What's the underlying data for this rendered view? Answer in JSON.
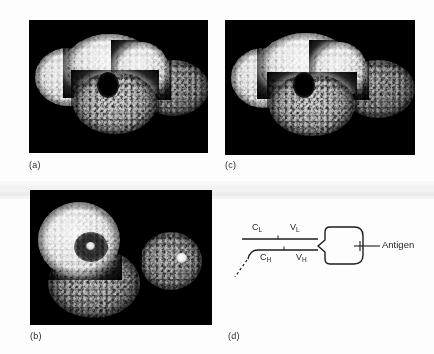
{
  "figure": {
    "background_color": "#fdfdfd",
    "panel_background": "#000000"
  },
  "panels": [
    {
      "id": "a",
      "label": "(a)",
      "type": "space-filling-model",
      "caption_text": "(a)",
      "description": "Space-filling model of an intact antibody molecule, front view"
    },
    {
      "id": "b",
      "label": "(b)",
      "type": "space-filling-model",
      "caption_text": "(b)",
      "description": "Space-filling model of an intact antibody molecule, rotated view"
    },
    {
      "id": "c",
      "label": "(c)",
      "type": "space-filling-model",
      "caption_text": "(c)",
      "description": "Space-filling model of an intact antibody molecule, stereo pair partner of (a)"
    },
    {
      "id": "d",
      "label": "(d)",
      "type": "schematic-diagram",
      "caption_text": "(d)",
      "description": "Schematic of antibody chains binding antigen"
    }
  ],
  "diagram": {
    "light_chain": {
      "constant_domain": "C",
      "constant_subscript": "L",
      "variable_domain": "V",
      "variable_subscript": "L"
    },
    "heavy_chain": {
      "constant_domain": "C",
      "constant_subscript": "H",
      "variable_domain": "V",
      "variable_subscript": "H"
    },
    "antigen_label": "Antigen",
    "line_color": "#1d1d1d"
  }
}
